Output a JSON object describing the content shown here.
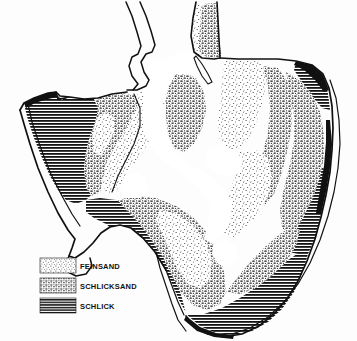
{
  "figure": {
    "kind": "sediment-distribution-map",
    "background_color": "#ffffff",
    "ink_color": "#111111"
  },
  "legend": {
    "items": [
      {
        "key": "feinsand",
        "label": "FEINSAND",
        "pattern": "fine-sparse-stipple",
        "density": "light",
        "swatch_color": "#efefef"
      },
      {
        "key": "schlicksand",
        "label": "SCHLICKSAND",
        "pattern": "coarse-mottled-dot",
        "density": "medium",
        "swatch_color": "#9a9a9a"
      },
      {
        "key": "schlick",
        "label": "SCHLICK",
        "pattern": "horizontal-lines",
        "density": "dark",
        "swatch_color": "#2a2a2a"
      }
    ],
    "swatch_width": 36,
    "swatch_height": 15,
    "rows_y": [
      258,
      278,
      298
    ],
    "swatch_x": 40,
    "label_x": 80
  },
  "map": {
    "zones": [
      {
        "key": "schlick",
        "name": "schlick-west-lobe",
        "label": "SCHLICK"
      },
      {
        "key": "schlick",
        "name": "schlick-south-belt",
        "label": "SCHLICK"
      },
      {
        "key": "schlick",
        "name": "schlick-southeast-margin",
        "label": "SCHLICK"
      },
      {
        "key": "schlicksand",
        "name": "schlicksand-central-transition",
        "label": "SCHLICKSAND"
      },
      {
        "key": "schlicksand",
        "name": "schlicksand-east-margin",
        "label": "SCHLICKSAND"
      },
      {
        "key": "schlicksand",
        "name": "schlicksand-south-flats",
        "label": "SCHLICKSAND"
      },
      {
        "key": "schlicksand",
        "name": "schlicksand-north-spit",
        "label": "SCHLICKSAND"
      },
      {
        "key": "feinsand",
        "name": "feinsand-central-flats",
        "label": "FEINSAND"
      },
      {
        "key": "feinsand",
        "name": "feinsand-northeast-flats",
        "label": "FEINSAND"
      },
      {
        "key": "feinsand",
        "name": "feinsand-east-flats",
        "label": "FEINSAND"
      }
    ],
    "features": [
      {
        "name": "north-inlet-channel",
        "type": "channel-outline"
      },
      {
        "name": "central-tidal-channel",
        "type": "unfilled-water"
      },
      {
        "name": "outer-coastline",
        "type": "outline"
      },
      {
        "name": "small-sandbank-sliver",
        "type": "island"
      },
      {
        "name": "southwest-tail",
        "type": "outline"
      }
    ]
  }
}
